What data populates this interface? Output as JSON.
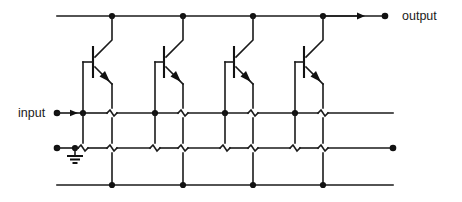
{
  "diagram": {
    "type": "circuit-schematic",
    "width": 462,
    "height": 202,
    "background_color": "#ffffff",
    "line_color": "#1a1a1a"
  },
  "labels": {
    "output": "output",
    "input": "input"
  },
  "rails": {
    "collector_rail": {
      "name": "collector-output-rail",
      "y": 16,
      "x_start": 57,
      "x_end": 362,
      "junction_x": [
        112,
        183,
        253,
        323
      ],
      "terminal_dot_x": 385,
      "arrow_tip_x": 363
    },
    "base_input_rail": {
      "name": "base-input-rail",
      "y": 113,
      "x_start": 57,
      "x_end": 393,
      "junction_x": [
        83,
        155,
        225,
        295
      ],
      "terminal_dot_x": 57,
      "arrow_tip_x": 76,
      "hop_x": [
        112,
        183,
        253,
        323
      ]
    },
    "ground_rail": {
      "name": "ground-rail",
      "y": 148,
      "x_start": 57,
      "x_end": 393,
      "terminal_dot_x": [
        57,
        393
      ],
      "ground_symbol_x": 75,
      "hop_x": [
        83,
        112,
        155,
        183,
        225,
        253,
        295,
        323
      ]
    },
    "emitter_rail": {
      "name": "emitter-return-rail",
      "y": 185,
      "x_start": 57,
      "x_end": 393,
      "junction_x": [
        112,
        183,
        253,
        323
      ]
    }
  },
  "transistors": [
    {
      "id": "Q1",
      "type": "npn",
      "base_x": 83,
      "collector_x": 112,
      "emitter_x": 112,
      "body_y": 62
    },
    {
      "id": "Q2",
      "type": "npn",
      "base_x": 155,
      "collector_x": 183,
      "emitter_x": 183,
      "body_y": 62
    },
    {
      "id": "Q3",
      "type": "npn",
      "base_x": 225,
      "collector_x": 253,
      "emitter_x": 253,
      "body_y": 62
    },
    {
      "id": "Q4",
      "type": "npn",
      "base_x": 295,
      "collector_x": 323,
      "emitter_x": 323,
      "body_y": 62
    }
  ],
  "symbols": {
    "ground": {
      "name": "ground-symbol",
      "bar_widths": [
        16,
        10,
        5
      ],
      "bar_gap": 3.5
    },
    "arrow": {
      "name": "direction-arrow",
      "length": 7,
      "half_height": 3.4
    },
    "node_dot_radius": 3.1,
    "terminal_dot_radius": 3.3
  }
}
